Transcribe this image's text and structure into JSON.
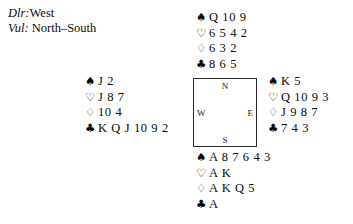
{
  "header": {
    "dealer_label": "Dlr:",
    "dealer_value": "West",
    "vul_label": "Vul:",
    "vul_value": "North–South"
  },
  "compass": {
    "north": "N",
    "south": "S",
    "west": "W",
    "east": "E"
  },
  "suit_symbols": {
    "spade": "♠",
    "heart": "♡",
    "diamond": "♢",
    "club": "♣"
  },
  "hands": {
    "north": {
      "spades": "Q 10 9",
      "hearts": "6 5 4 2",
      "diamonds": "6 3 2",
      "clubs": "8 6 5"
    },
    "west": {
      "spades": "J 2",
      "hearts": "J 8 7",
      "diamonds": "10 4",
      "clubs": "K Q J 10 9 2"
    },
    "east": {
      "spades": "K 5",
      "hearts": "Q 10 9 3",
      "diamonds": "J 9 8 7",
      "clubs": "7 4 3"
    },
    "south": {
      "spades": "A 8 7 6 4 3",
      "hearts": "A K",
      "diamonds": "A K Q 5",
      "clubs": "A"
    }
  }
}
